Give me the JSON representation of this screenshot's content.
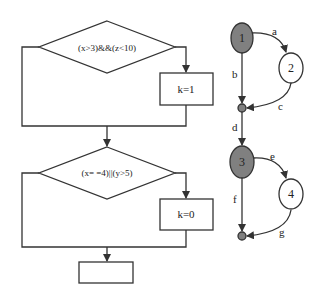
{
  "flowchart": {
    "decision1": {
      "label": "(x>3)&&(z<10)"
    },
    "process1": {
      "label": "k=1"
    },
    "decision2": {
      "label": "(x= =4)||(y>5)"
    },
    "process2": {
      "label": "k=0"
    },
    "end_box": {
      "label": ""
    }
  },
  "graph": {
    "nodes": [
      {
        "id": "1",
        "label": "1",
        "fill": "#808080"
      },
      {
        "id": "2",
        "label": "2",
        "fill": "#ffffff"
      },
      {
        "id": "j1",
        "label": "",
        "fill": "#808080"
      },
      {
        "id": "3",
        "label": "3",
        "fill": "#808080"
      },
      {
        "id": "4",
        "label": "4",
        "fill": "#ffffff"
      },
      {
        "id": "j2",
        "label": "",
        "fill": "#808080"
      }
    ],
    "edges": [
      {
        "label": "a",
        "from": "1",
        "to": "2"
      },
      {
        "label": "b",
        "from": "1",
        "to": "j1"
      },
      {
        "label": "c",
        "from": "2",
        "to": "j1"
      },
      {
        "label": "d",
        "from": "j1",
        "to": "3"
      },
      {
        "label": "e",
        "from": "3",
        "to": "4"
      },
      {
        "label": "f",
        "from": "3",
        "to": "j2"
      },
      {
        "label": "g",
        "from": "4",
        "to": "j2"
      }
    ]
  }
}
